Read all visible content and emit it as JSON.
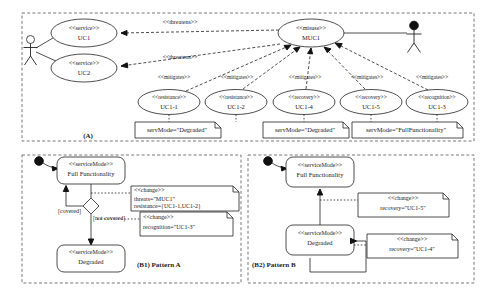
{
  "figure": {
    "panel_a_label": "(A)",
    "panel_b1_label": "(B1) Pattern A",
    "panel_b2_label": "(B2) Pattern B"
  },
  "stereotypes": {
    "service": "<<service>>",
    "misuse": "<<misuse>>",
    "resistance": "<<resistance>>",
    "recovery": "<<recovery>>",
    "recognition": "<<recognition>>",
    "service_mode": "<<serviceMode>>",
    "change": "<<change>>"
  },
  "relations": {
    "threatens": "<<threatens>>",
    "mitigates": "<<mitigates>>"
  },
  "panel_a": {
    "use_cases": [
      {
        "stereotype": "<<service>>",
        "name": "UC1"
      },
      {
        "stereotype": "<<service>>",
        "name": "UC2"
      }
    ],
    "misuse_case": {
      "stereotype": "<<misuse>>",
      "name": "MUC1"
    },
    "threatens_labels": [
      "<<threatens>>",
      "<<threatens>>"
    ],
    "mitigation_use_cases": [
      {
        "stereotype": "<<resistance>>",
        "name": "UC1-1"
      },
      {
        "stereotype": "<<resistance>>",
        "name": "UC1-2"
      },
      {
        "stereotype": "<<recovery>>",
        "name": "UC1-4"
      },
      {
        "stereotype": "<<recovery>>",
        "name": "UC1-5"
      },
      {
        "stereotype": "<<recognition>>",
        "name": "UC1-3"
      }
    ],
    "mitigates_labels": [
      "<<mitigates>>",
      "<<mitigates>>",
      "<<mitigates>>",
      "<<mitigates>>",
      "<<mitigates>>"
    ],
    "notes": [
      {
        "text": "servMode=\"Degraded\""
      },
      {
        "text": "servMode=\"Degraded\""
      },
      {
        "text": "servMode=\"FullFunctionality\""
      }
    ],
    "actors": {
      "user": "user-actor",
      "attacker": "attacker-actor"
    }
  },
  "panel_b1": {
    "states": [
      {
        "stereotype": "<<serviceMode>>",
        "name": "Full Functionality"
      },
      {
        "stereotype": "<<serviceMode>>",
        "name": "Degraded"
      }
    ],
    "guards": [
      "[covered]",
      "[not covered]"
    ],
    "notes": [
      {
        "stereotype": "<<change>>",
        "lines": [
          "threats=\"MUC1\"",
          "resistance={UC1-1,UC1-2}"
        ]
      },
      {
        "stereotype": "<<change>>",
        "lines": [
          "recognition=\"UC1-3\""
        ]
      }
    ]
  },
  "panel_b2": {
    "states": [
      {
        "stereotype": "<<serviceMode>>",
        "name": "Full Functionality"
      },
      {
        "stereotype": "<<serviceMode>>",
        "name": "Degraded"
      }
    ],
    "notes": [
      {
        "stereotype": "<<change>>",
        "lines": [
          "recovery=\"UC1-5\""
        ]
      },
      {
        "stereotype": "<<change>>",
        "lines": [
          "recovery=\"UC1-4\""
        ]
      }
    ]
  },
  "colors": {
    "stroke": "#222222",
    "panel_stroke": "#555555",
    "fill": "#ffffff",
    "text": "#1a1a1a"
  }
}
